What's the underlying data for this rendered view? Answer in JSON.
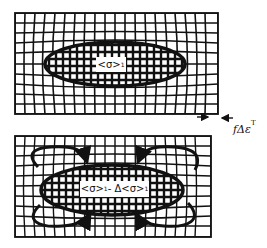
{
  "figure": {
    "panels": [
      {
        "id": "top",
        "description": "Distorted grid with elliptical inclusion under uniform stress",
        "inclusion_label": {
          "main": "<σ>",
          "sub": "1"
        }
      },
      {
        "id": "bottom",
        "description": "Distorted grid with elliptical inclusion, reduced stress with curved relaxation arrows",
        "inclusion_label": {
          "main": "<σ>",
          "sub": "1",
          "minus": " - Δ<σ>",
          "sub2": "1"
        }
      }
    ],
    "strain_annotation": {
      "text": "fΔε",
      "superscript": "T",
      "arrows": [
        "right-arrow",
        "left-arrow"
      ]
    },
    "colors": {
      "ink": "#111111",
      "background": "#ffffff"
    }
  }
}
